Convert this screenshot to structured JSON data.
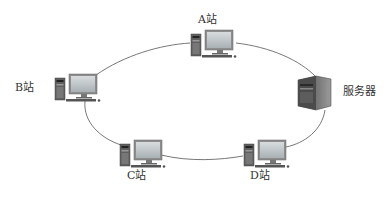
{
  "diagram": {
    "type": "ring-network-topology",
    "nodes": [
      {
        "id": "A",
        "label": "A站",
        "kind": "workstation"
      },
      {
        "id": "B",
        "label": "B站",
        "kind": "workstation"
      },
      {
        "id": "C",
        "label": "C站",
        "kind": "workstation"
      },
      {
        "id": "D",
        "label": "D站",
        "kind": "workstation"
      },
      {
        "id": "S",
        "label": "服务器",
        "kind": "server"
      }
    ],
    "edges": [
      {
        "from": "A",
        "to": "S"
      },
      {
        "from": "S",
        "to": "D"
      },
      {
        "from": "D",
        "to": "C"
      },
      {
        "from": "C",
        "to": "B"
      },
      {
        "from": "B",
        "to": "A"
      }
    ],
    "colors": {
      "line": "#555555",
      "monitor_frame": "#8a8a8a",
      "monitor_screen": "#b8c0c4",
      "tower": "#6b6b6b",
      "server_body": "#5a5a5a",
      "label": "#333333"
    }
  }
}
